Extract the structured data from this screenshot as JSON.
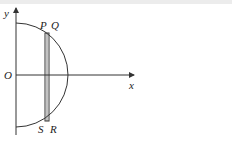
{
  "diagram": {
    "type": "geometry",
    "axes": {
      "x_label": "x",
      "y_label": "y",
      "origin_label": "O"
    },
    "points": {
      "P": {
        "label": "P"
      },
      "Q": {
        "label": "Q"
      },
      "R": {
        "label": "R"
      },
      "S": {
        "label": "S"
      }
    },
    "colors": {
      "stroke": "#333333",
      "background": "#ffffff",
      "top_band": "#ececec"
    }
  }
}
